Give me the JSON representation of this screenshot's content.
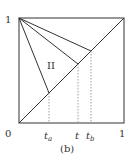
{
  "diagram": {
    "caption": "(b)",
    "region_label": "II",
    "axis": {
      "origin_label": "0",
      "x_end_label": "1",
      "y_end_label": "1"
    },
    "ticks": [
      {
        "name": "t_a",
        "base": "t",
        "sub": "a",
        "x": 0.29
      },
      {
        "name": "t",
        "base": "t",
        "sub": "",
        "x": 0.56
      },
      {
        "name": "t_b",
        "base": "t",
        "sub": "b",
        "x": 0.69
      }
    ],
    "colors": {
      "line": "#333333",
      "dotted": "#888888",
      "background": "#ffffff"
    }
  }
}
